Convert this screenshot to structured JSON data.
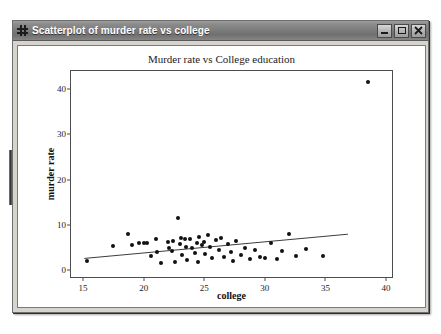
{
  "window": {
    "title": "Scatterplot of murder rate vs college",
    "icon": "grid-window-icon",
    "minimize_label": "Minimize",
    "maximize_label": "Maximize",
    "close_label": "Close"
  },
  "chart_data": {
    "type": "scatter",
    "title": "Murder rate vs College education",
    "xlabel": "college",
    "ylabel": "murder rate",
    "xlim": [
      14.0,
      40.5
    ],
    "ylim": [
      -1.5,
      44.0
    ],
    "xticks": [
      15,
      20,
      25,
      30,
      35,
      40
    ],
    "yticks": [
      0,
      10,
      20,
      30,
      40
    ],
    "grid": false,
    "legend": null,
    "series": [
      {
        "name": "states",
        "marker": "filled-circle",
        "color": "#111111",
        "points": [
          [
            15.3,
            2.0
          ],
          [
            17.5,
            5.4
          ],
          [
            18.7,
            8.0
          ],
          [
            19.0,
            5.5
          ],
          [
            19.6,
            6.0
          ],
          [
            20.0,
            5.9
          ],
          [
            20.3,
            6.1
          ],
          [
            20.6,
            3.2
          ],
          [
            21.0,
            7.0
          ],
          [
            21.1,
            4.1
          ],
          [
            21.4,
            1.6
          ],
          [
            22.0,
            6.3
          ],
          [
            22.1,
            5.0
          ],
          [
            22.3,
            4.2
          ],
          [
            22.4,
            6.5
          ],
          [
            22.6,
            1.8
          ],
          [
            22.8,
            11.6
          ],
          [
            23.0,
            5.8
          ],
          [
            23.1,
            7.2
          ],
          [
            23.2,
            3.4
          ],
          [
            23.4,
            6.8
          ],
          [
            23.5,
            5.2
          ],
          [
            23.6,
            2.2
          ],
          [
            23.8,
            6.9
          ],
          [
            24.0,
            4.9
          ],
          [
            24.2,
            3.8
          ],
          [
            24.4,
            6.0
          ],
          [
            24.5,
            1.9
          ],
          [
            24.6,
            7.4
          ],
          [
            24.8,
            5.6
          ],
          [
            25.0,
            6.2
          ],
          [
            25.1,
            3.6
          ],
          [
            25.3,
            7.8
          ],
          [
            25.5,
            5.1
          ],
          [
            25.6,
            2.6
          ],
          [
            26.0,
            6.6
          ],
          [
            26.2,
            4.5
          ],
          [
            26.4,
            7.1
          ],
          [
            26.6,
            3.0
          ],
          [
            27.0,
            5.7
          ],
          [
            27.2,
            4.0
          ],
          [
            27.4,
            2.0
          ],
          [
            27.6,
            6.4
          ],
          [
            28.0,
            3.3
          ],
          [
            28.4,
            5.0
          ],
          [
            28.8,
            2.4
          ],
          [
            29.2,
            4.4
          ],
          [
            29.6,
            3.0
          ],
          [
            30.0,
            2.8
          ],
          [
            30.5,
            5.9
          ],
          [
            31.0,
            2.5
          ],
          [
            31.4,
            4.2
          ],
          [
            32.0,
            8.0
          ],
          [
            32.6,
            3.1
          ],
          [
            33.4,
            4.6
          ],
          [
            34.8,
            3.2
          ],
          [
            38.5,
            41.5
          ]
        ]
      }
    ],
    "trendline": {
      "name": "least-squares fit",
      "color": "#3a3a3a",
      "x_start": 15.1,
      "y_start": 2.2,
      "x_end": 37.0,
      "y_end": 7.6
    }
  }
}
